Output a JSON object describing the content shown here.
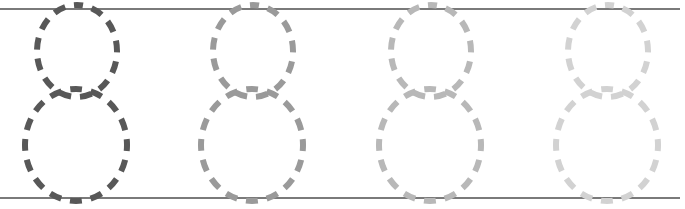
{
  "worksheet": {
    "type": "number tracing",
    "digit": "8",
    "repetitions": 4,
    "guide_lines": {
      "top_y": 8,
      "bottom_y": 198,
      "color": "#7a7a7a"
    },
    "digits": [
      {
        "label": "8",
        "cx": 76,
        "color": "#585858"
      },
      {
        "label": "8",
        "cx": 252,
        "color": "#9a9a9a"
      },
      {
        "label": "8",
        "cx": 430,
        "color": "#b8b8b8"
      },
      {
        "label": "8",
        "cx": 607,
        "color": "#d2d2d2"
      }
    ]
  }
}
